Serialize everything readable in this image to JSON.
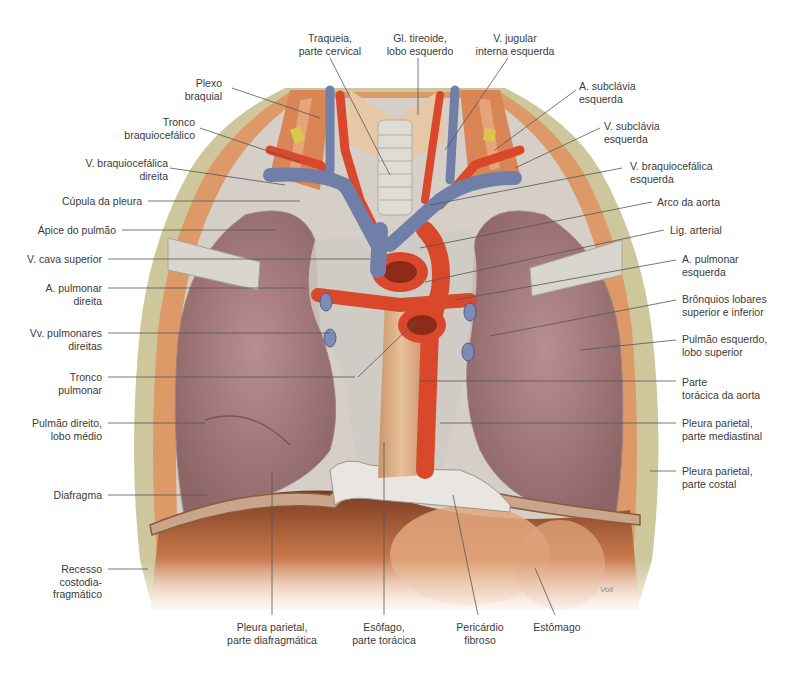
{
  "figure": {
    "type": "anatomical-illustration",
    "signature": "Voll",
    "colors": {
      "artery": "#d9482b",
      "vein": "#6f7fa8",
      "lung": "#b58a8e",
      "pleura": "#cfc9c2",
      "muscle": "#d9935f",
      "fat": "#c9c79a",
      "leader_line": "#555555",
      "label_text": "#3a3a3a"
    }
  },
  "labels": {
    "top": [
      {
        "id": "traqueia",
        "text": "Traqueia,\nparte cervical"
      },
      {
        "id": "tireoide",
        "text": "Gl. tireoide,\nlobo esquerdo"
      },
      {
        "id": "jugular",
        "text": "V. jugular\ninterna esquerda"
      }
    ],
    "left": [
      {
        "id": "plexo",
        "text": "Plexo\nbraquial"
      },
      {
        "id": "tronco_braq",
        "text": "Tronco\nbraquiocefálico"
      },
      {
        "id": "v_braq_dir",
        "text": "V. braquiocefálica\ndireita"
      },
      {
        "id": "cupula",
        "text": "Cúpula da pleura"
      },
      {
        "id": "apice",
        "text": "Ápice do pulmão"
      },
      {
        "id": "cava",
        "text": "V. cava superior"
      },
      {
        "id": "a_pulm_dir",
        "text": "A. pulmonar\ndireita"
      },
      {
        "id": "vv_pulm_dir",
        "text": "Vv. pulmonares\ndireitas"
      },
      {
        "id": "tronco_pulm",
        "text": "Tronco\npulmonar"
      },
      {
        "id": "pulm_dir_medio",
        "text": "Pulmão direito,\nlobo médio"
      },
      {
        "id": "diafragma",
        "text": "Diafragma"
      },
      {
        "id": "recesso",
        "text": "Recesso\ncostodia-\nfragmático"
      }
    ],
    "right": [
      {
        "id": "a_subclavia_esq",
        "text": "A. subclávia\nesquerda"
      },
      {
        "id": "v_subclavia_esq",
        "text": "V. subclávia\nesquerda"
      },
      {
        "id": "v_braq_esq",
        "text": "V. braquiocefálica\nesquerda"
      },
      {
        "id": "arco_aorta",
        "text": "Arco da aorta"
      },
      {
        "id": "lig_arterial",
        "text": "Lig. arterial"
      },
      {
        "id": "a_pulm_esq",
        "text": "A. pulmonar\nesquerda"
      },
      {
        "id": "bronquios",
        "text": "Brônquios lobares\nsuperior e inferior"
      },
      {
        "id": "pulm_esq_sup",
        "text": "Pulmão esquerdo,\nlobo superior"
      },
      {
        "id": "aorta_toracica",
        "text": "Parte\ntorácica da aorta"
      },
      {
        "id": "pleura_mediastinal",
        "text": "Pleura parietal,\nparte mediastinal"
      },
      {
        "id": "pleura_costal",
        "text": "Pleura parietal,\nparte costal"
      }
    ],
    "bottom": [
      {
        "id": "pleura_diafrag",
        "text": "Pleura parietal,\nparte diafragmática"
      },
      {
        "id": "esofago",
        "text": "Esôfago,\nparte torácica"
      },
      {
        "id": "pericardio",
        "text": "Pericárdio\nfibroso"
      },
      {
        "id": "estomago",
        "text": "Estômago"
      }
    ]
  }
}
